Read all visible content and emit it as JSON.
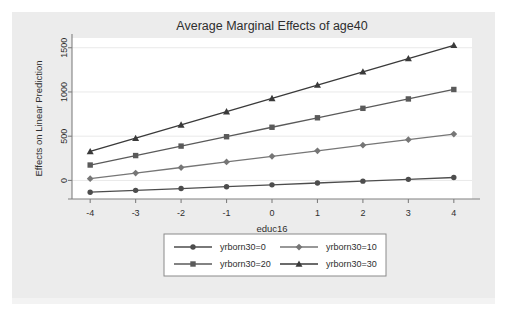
{
  "chart_data": {
    "type": "line",
    "title": "Average Marginal Effects of age40",
    "xlabel": "educ16",
    "ylabel": "Effects on Linear Prediction",
    "x": [
      -4,
      -3,
      -2,
      -1,
      0,
      1,
      2,
      3,
      4
    ],
    "xticks": [
      "-4",
      "-3",
      "-2",
      "-1",
      "0",
      "1",
      "2",
      "3",
      "4"
    ],
    "yticks": [
      "0",
      "500",
      "1000",
      "1500"
    ],
    "ytickvalues": [
      0,
      500,
      1000,
      1500
    ],
    "xlim": [
      -4.4,
      4.4
    ],
    "ylim": [
      -210,
      1610
    ],
    "grid": "horizontal",
    "legend_position": "bottom",
    "series": [
      {
        "name": "yrborn30=0",
        "marker": "circle",
        "color": "#4d4d4d",
        "values": [
          -133,
          -112,
          -92,
          -71,
          -50,
          -29,
          -8,
          12,
          33
        ]
      },
      {
        "name": "yrborn30=10",
        "marker": "diamond",
        "color": "#767676",
        "values": [
          20,
          83,
          146,
          209,
          272,
          335,
          398,
          461,
          524
        ]
      },
      {
        "name": "yrborn30=20",
        "marker": "square",
        "color": "#5a5a5a",
        "values": [
          174,
          281,
          388,
          494,
          601,
          708,
          815,
          921,
          1028
        ]
      },
      {
        "name": "yrborn30=30",
        "marker": "triangle",
        "color": "#3a3a3a",
        "values": [
          328,
          478,
          628,
          778,
          928,
          1078,
          1228,
          1378,
          1528
        ]
      }
    ]
  },
  "legend": {
    "items": [
      {
        "label": "yrborn30=0"
      },
      {
        "label": "yrborn30=10"
      },
      {
        "label": "yrborn30=20"
      },
      {
        "label": "yrborn30=30"
      }
    ]
  },
  "colors": {
    "page_background": "#ffffff",
    "figure_background": "#ececec",
    "plot_background": "#ffffff",
    "axis": "#808080",
    "grid": "#e9e9e9",
    "text": "#2e2e2e"
  }
}
